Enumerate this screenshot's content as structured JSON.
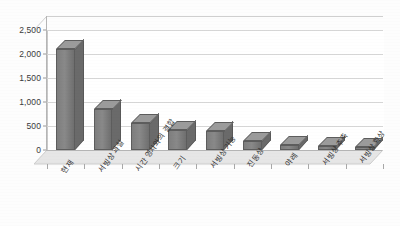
{
  "chart_data": {
    "type": "bar",
    "title": "",
    "subtitle": "",
    "xlabel": "",
    "ylabel": "",
    "categories": [
      "현재",
      "서빙상 과실",
      "시간 영사와의 결합",
      "크기",
      "서빙상 기능",
      "진동상",
      "야레",
      "서빙상 추측",
      "서빙상 확상"
    ],
    "values": [
      2100,
      850,
      570,
      420,
      400,
      180,
      110,
      90,
      70
    ],
    "ylim": [
      0,
      2500
    ],
    "yticks": [
      0,
      500,
      1000,
      1500,
      2000,
      2500
    ],
    "ytick_labels": [
      "0",
      "500",
      "1,000",
      "1,500",
      "2,000",
      "2,500"
    ],
    "grid": true,
    "legend": false,
    "legend_position": "none",
    "style": "3d-column",
    "bar_color": "#808080",
    "bar_top_color": "#9b9b9b",
    "bar_side_color": "#6a6a6a",
    "gridline_color": "#d7d7d7",
    "axis_color": "#b5b5b5",
    "plot_background": "#ffffff",
    "floor_color": "#e4e4e4",
    "label_rotation_deg": -55,
    "series": [
      {
        "name": "series-1",
        "values": [
          2100,
          850,
          570,
          420,
          400,
          180,
          110,
          90,
          70
        ]
      }
    ]
  }
}
